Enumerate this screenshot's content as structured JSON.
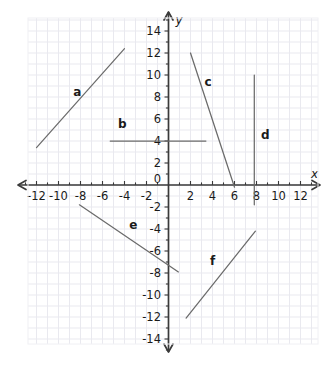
{
  "chart_data": {
    "type": "line",
    "title": "",
    "xlabel": "x",
    "ylabel": "y",
    "xlim": [
      -13.5,
      13.5
    ],
    "ylim": [
      -15,
      15
    ],
    "grid": true,
    "grid_step": 1,
    "xticks": [
      -12,
      -10,
      -8,
      -6,
      -4,
      -2,
      2,
      4,
      6,
      8,
      10,
      12
    ],
    "yticks": [
      14,
      12,
      10,
      8,
      6,
      4,
      2,
      -2,
      -4,
      -6,
      -8,
      -10,
      -12,
      -14
    ],
    "xtick_labels": [
      "-12",
      "-10",
      "-8",
      "-6",
      "-4",
      "-2",
      "2",
      "4",
      "6",
      "8",
      "10",
      "12"
    ],
    "ytick_labels": [
      "14",
      "12",
      "10",
      "8",
      "6",
      "4",
      "2",
      "-2",
      "-4",
      "-6",
      "-8",
      "-10",
      "-12",
      "-14"
    ],
    "origin_label": "0",
    "axis_color": "#3a3a3a",
    "grid_color": "#e9e9ef",
    "line_color": "#6b6b6b",
    "label_color": "#1a1a1a",
    "series": [
      {
        "name": "a",
        "label": "a",
        "x": [
          -12.0,
          -4.0
        ],
        "y": [
          3.4,
          12.4
        ],
        "label_x": -8.3,
        "label_y": 8.1
      },
      {
        "name": "b",
        "label": "b",
        "x": [
          -5.3,
          3.4
        ],
        "y": [
          4.0,
          4.0
        ],
        "label_x": -4.2,
        "label_y": 5.2
      },
      {
        "name": "c",
        "label": "c",
        "x": [
          2.0,
          6.0
        ],
        "y": [
          12.0,
          -0.2
        ],
        "label_x": 3.6,
        "label_y": 9.0
      },
      {
        "name": "d",
        "label": "d",
        "x": [
          7.8,
          7.8
        ],
        "y": [
          10.0,
          -1.8
        ],
        "label_x": 8.8,
        "label_y": 4.2
      },
      {
        "name": "e",
        "label": "e",
        "x": [
          -8.1,
          0.9
        ],
        "y": [
          -1.8,
          -7.9
        ],
        "label_x": -3.2,
        "label_y": -4.0
      },
      {
        "name": "f",
        "label": "f",
        "x": [
          1.6,
          7.9
        ],
        "y": [
          -12.1,
          -4.2
        ],
        "label_x": 4.0,
        "label_y": -7.3
      }
    ]
  },
  "axes": {
    "x_axis_label": "x",
    "y_axis_label": "y",
    "origin_label": "0"
  }
}
